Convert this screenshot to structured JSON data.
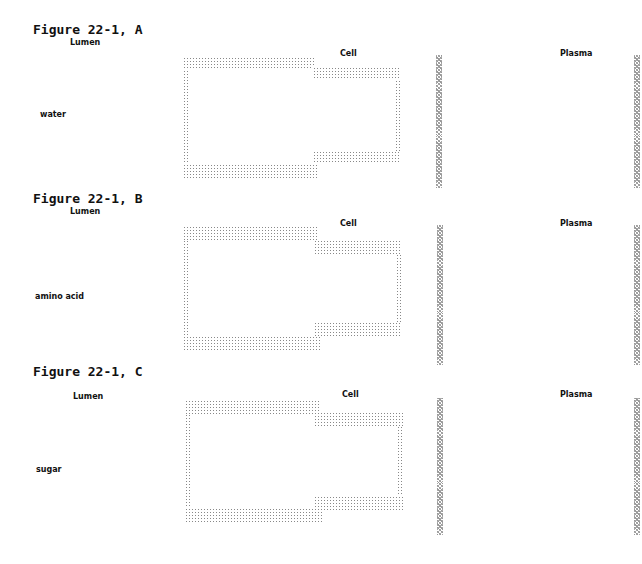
{
  "panels": [
    {
      "title": "Figure 22-1, A",
      "lumen_label": "Lumen",
      "cell_label": "Cell",
      "plasma_label": "Plasma",
      "substance": "water"
    },
    {
      "title": "Figure 22-1, B",
      "lumen_label": "Lumen",
      "cell_label": "Cell",
      "plasma_label": "Plasma",
      "substance": "amino acid"
    },
    {
      "title": "Figure 22-1, C",
      "lumen_label": "Lumen",
      "cell_label": "Cell",
      "plasma_label": "Plasma",
      "substance": "sugar"
    }
  ],
  "colors": {
    "stipple": "#888888",
    "text": "#111111",
    "background": "#ffffff"
  }
}
